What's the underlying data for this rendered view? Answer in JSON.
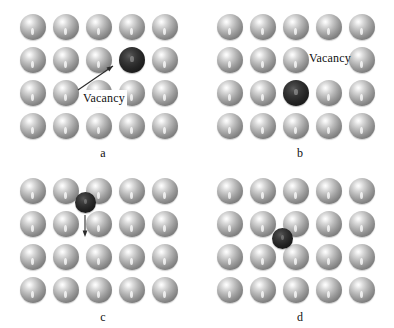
{
  "figure": {
    "background_color": "#ffffff",
    "width": 394,
    "height": 328,
    "atom_color_normal": "#a9a9a9",
    "atom_color_defect": "#1f1f1f"
  },
  "panels": [
    {
      "id": "a",
      "caption": "a",
      "caption_x": 93,
      "caption_y": 146,
      "origin_x": 0,
      "origin_y": 0,
      "grid": {
        "rows": 4,
        "cols": 5,
        "x0": 20,
        "y0": 14,
        "dx": 33,
        "dy": 33,
        "size": 26
      },
      "defect": {
        "kind": "substitutional-dark-atom",
        "row": 2,
        "col": 4,
        "x": 119,
        "y": 47
      },
      "label": {
        "text": "Vacancy",
        "x": 81,
        "y": 90
      },
      "arrow": {
        "kind": "diagonal-up-right",
        "x1": 78,
        "y1": 90,
        "x2": 113,
        "y2": 66
      }
    },
    {
      "id": "b",
      "caption": "b",
      "caption_x": 290,
      "caption_y": 146,
      "origin_x": 197,
      "origin_y": 0,
      "grid": {
        "rows": 4,
        "cols": 5,
        "x0": 20,
        "y0": 14,
        "dx": 33,
        "dy": 33,
        "size": 26
      },
      "missing_cell": {
        "row": 2,
        "col": 4
      },
      "defect": {
        "kind": "substitutional-dark-atom",
        "row": 3,
        "col": 3,
        "x": 86,
        "y": 80
      },
      "label": {
        "text": "Vacancy",
        "x": 112,
        "y": 51
      },
      "arrow": null
    },
    {
      "id": "c",
      "caption": "c",
      "caption_x": 93,
      "caption_y": 310,
      "origin_x": 0,
      "origin_y": 164,
      "grid": {
        "rows": 4,
        "cols": 5,
        "x0": 20,
        "y0": 14,
        "dx": 33,
        "dy": 33,
        "size": 26
      },
      "defect": {
        "kind": "interstitial-dark-atom",
        "x": 75,
        "y": 28,
        "size": 21
      },
      "label": null,
      "arrow": {
        "kind": "vertical-down",
        "x1": 85,
        "y1": 51,
        "x2": 85,
        "y2": 72
      }
    },
    {
      "id": "d",
      "caption": "d",
      "caption_x": 290,
      "caption_y": 310,
      "origin_x": 197,
      "origin_y": 164,
      "grid": {
        "rows": 4,
        "cols": 5,
        "x0": 20,
        "y0": 14,
        "dx": 33,
        "dy": 33,
        "size": 26
      },
      "defect": {
        "kind": "interstitial-dark-atom",
        "x": 75,
        "y": 64,
        "size": 21
      },
      "label": null,
      "arrow": null
    }
  ]
}
